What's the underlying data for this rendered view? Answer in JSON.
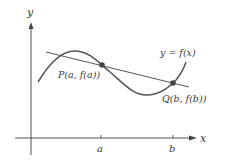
{
  "diagram": {
    "type": "mean-value-theorem-secant",
    "axes": {
      "x_label": "x",
      "y_label": "y"
    },
    "ticks": [
      {
        "label": "a"
      },
      {
        "label": "b"
      }
    ],
    "curve_label": "y = f(x)",
    "points": [
      {
        "name": "P",
        "label": "P(a, f(a))"
      },
      {
        "name": "Q",
        "label": "Q(b, f(b))"
      }
    ],
    "colors": {
      "stroke": "#4a4a4a",
      "text": "#3a3a3a",
      "background": "#ffffff"
    }
  }
}
